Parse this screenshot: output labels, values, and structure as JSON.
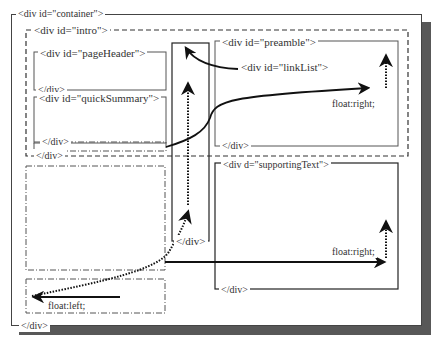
{
  "diagram": {
    "container": {
      "open_tag": "<div id=\"container\">",
      "close_tag": "</div>"
    },
    "intro": {
      "open_tag": "<div id=\"intro\">",
      "close_tag": "</div>"
    },
    "pageHeader": {
      "open_tag": "<div id=\"pageHeader\">",
      "close_tag": "</div>"
    },
    "quickSummary": {
      "open_tag": "<div id=\"quickSummary\">",
      "close_tag": "</div>"
    },
    "preamble": {
      "open_tag": "<div id=\"preamble\">",
      "close_tag": "</div>",
      "float_label": "float:right;"
    },
    "linkList": {
      "open_tag": "<div id=\"linkList\">",
      "close_tag": "</div>"
    },
    "supportingText": {
      "open_tag": "<div d=\"supportingText\">",
      "close_tag": "</div>",
      "float_label": "float:right;"
    },
    "floatLeftBox": {
      "float_label": "float:left;"
    }
  },
  "colors": {
    "line": "#333333",
    "shadow": "#555555",
    "background": "#ffffff"
  }
}
